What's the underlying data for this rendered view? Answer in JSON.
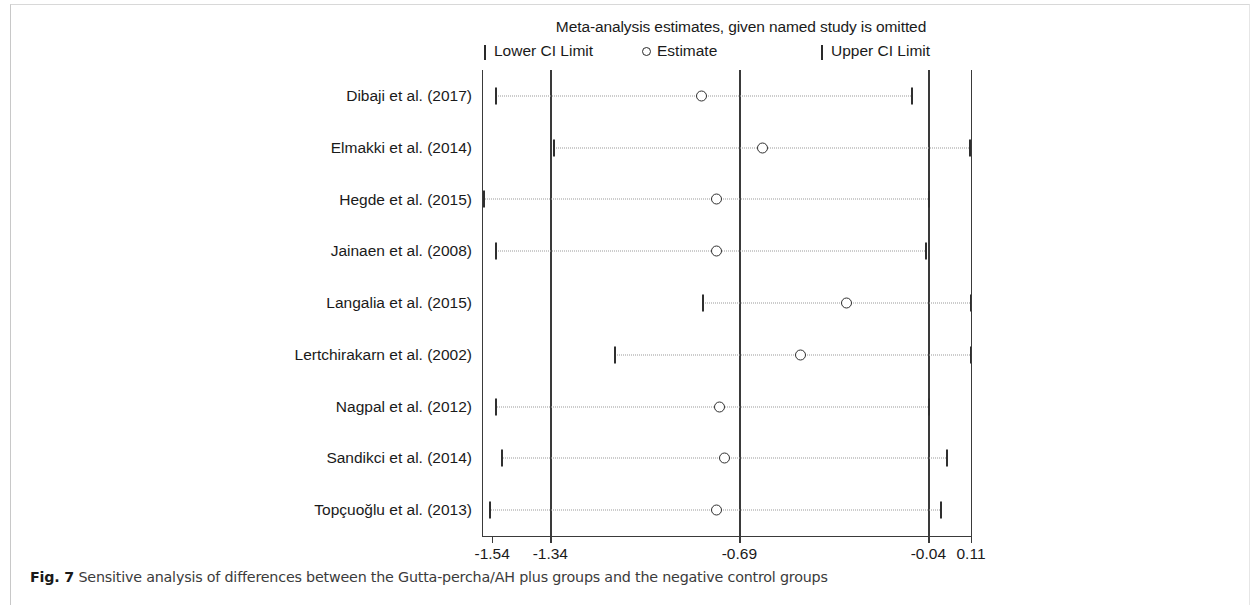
{
  "figure": {
    "caption_label": "Fig. 7",
    "caption_text": " Sensitive analysis of differences between the Gutta-percha/AH plus groups and the negative control groups"
  },
  "legend": {
    "lower_label": "Lower CI Limit",
    "estimate_label": "Estimate",
    "upper_label": "Upper CI Limit"
  },
  "chart_data": {
    "type": "scatter",
    "title": "Meta-analysis estimates, given named study is omitted",
    "subtitle": "",
    "xlabel": "",
    "ylabel": "",
    "xlim": [
      -1.575,
      0.11
    ],
    "grid": false,
    "legend_position": "top",
    "vertical_reference_lines": [
      -1.34,
      -0.69,
      -0.04
    ],
    "xticks": [
      -1.54,
      -1.34,
      -0.69,
      -0.04,
      0.11
    ],
    "xticklabels": [
      "-1.54",
      "-1.34",
      "-0.69",
      "-0.04",
      "0.11"
    ],
    "categories": [
      "Dibaji et al. (2017)",
      "Elmakki et al. (2014)",
      "Hegde et al. (2015)",
      "Jainaen et al.  (2008)",
      "Langalia et al. (2015)",
      "Lertchirakarn et al. (2002)",
      "Nagpal et al. (2012)",
      "Sandikci et al. (2014)",
      "Topçuoğlu et al. (2013)"
    ],
    "series": [
      {
        "name": "Lower CI Limit",
        "values": [
          -1.53,
          -1.33,
          -1.57,
          -1.53,
          -0.82,
          -1.12,
          -1.53,
          -1.51,
          -1.55
        ]
      },
      {
        "name": "Estimate",
        "values": [
          -0.82,
          -0.61,
          -0.77,
          -0.77,
          -0.32,
          -0.48,
          -0.76,
          -0.74,
          -0.77
        ]
      },
      {
        "name": "Upper CI Limit",
        "values": [
          -0.1,
          0.1,
          -0.04,
          -0.05,
          0.14,
          0.14,
          -0.04,
          0.02,
          0.0
        ]
      }
    ]
  },
  "colors": {
    "marker": "#2f2f2f",
    "ci_line": "#9a9a9a",
    "axis": "#3a3a3a",
    "text": "#1a1a1a",
    "caption": "#3b3b3b"
  }
}
